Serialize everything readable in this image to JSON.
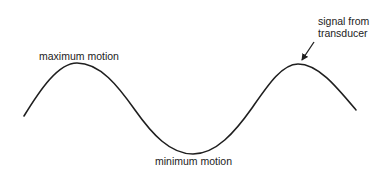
{
  "diagram": {
    "labels": {
      "maximum": "maximum motion",
      "minimum": "minimum motion",
      "signal_line1": "signal from",
      "signal_line2": "transducer"
    },
    "waveform": {
      "type": "sine",
      "cycles": 1.25,
      "stroke_color": "#1f1f1f",
      "start": [
        24,
        116
      ],
      "peak1": [
        77,
        63
      ],
      "trough": [
        193,
        154
      ],
      "peak2": [
        298,
        64
      ],
      "end": [
        356,
        110
      ]
    },
    "arrow": {
      "from": [
        314,
        42
      ],
      "to": [
        301,
        61
      ],
      "color": "#1f1f1f"
    }
  }
}
